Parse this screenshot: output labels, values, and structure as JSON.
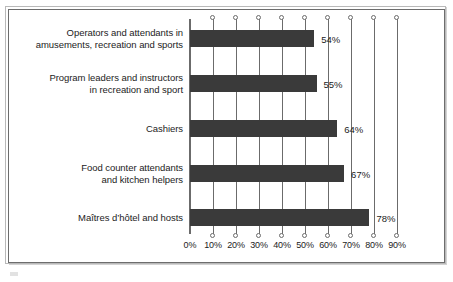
{
  "chart_data": {
    "type": "bar",
    "orientation": "horizontal",
    "title": "",
    "subtitle": "",
    "xlabel": "",
    "ylabel": "",
    "categories": [
      "Operators and attendants in amusements, recreation and sports",
      "Program leaders and instructors in recreation and sport",
      "Cashiers",
      "Food counter attendants and kitchen helpers",
      "Maîtres d’hôtel and hosts"
    ],
    "category_lines": [
      [
        "Operators and attendants in",
        "amusements, recreation and sports"
      ],
      [
        "Program leaders and instructors",
        "in recreation and sport"
      ],
      [
        "Cashiers"
      ],
      [
        "Food counter attendants",
        "and kitchen helpers"
      ],
      [
        "Maîtres d’hôtel and hosts"
      ]
    ],
    "values": [
      54,
      55,
      64,
      67,
      78
    ],
    "value_labels": [
      "54%",
      "55%",
      "64%",
      "67%",
      "78%"
    ],
    "xlim": [
      0,
      90
    ],
    "xticks": [
      0,
      10,
      20,
      30,
      40,
      50,
      60,
      70,
      80,
      90
    ],
    "xtick_labels": [
      "0%",
      "10%",
      "20%",
      "30%",
      "40%",
      "50%",
      "60%",
      "70%",
      "80%",
      "90%"
    ],
    "grid": true,
    "grid_axis": "x",
    "legend": null,
    "colors": {
      "bar": "#3a3a3a",
      "axis": "#6b6b6b",
      "grid": "#6b6b6b",
      "text": "#1c1c1c",
      "background": "#ffffff",
      "frame_outer": "#b9b9b9",
      "frame_inner": "#6d6d6d"
    }
  }
}
